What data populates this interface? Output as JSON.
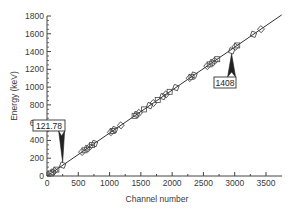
{
  "chart_data": {
    "type": "scatter",
    "title": "",
    "xlabel": "Channel number",
    "ylabel": "Energy (keV)",
    "xlim": [
      0,
      3750
    ],
    "ylim": [
      0,
      1800
    ],
    "xticks": [
      0,
      500,
      1000,
      1500,
      2000,
      2500,
      3000,
      3500
    ],
    "yticks": [
      0,
      200,
      400,
      600,
      800,
      1000,
      1200,
      1400,
      1600,
      1800
    ],
    "grid": false,
    "legend": null,
    "series": [
      {
        "name": "Calibration peaks",
        "marker": "open-square",
        "x": [
          60,
          90,
          120,
          150,
          250,
          560,
          600,
          640,
          680,
          720,
          760,
          1020,
          1050,
          1080,
          1180,
          1400,
          1430,
          1470,
          1550,
          1640,
          1700,
          1770,
          1850,
          1900,
          1960,
          2060,
          2280,
          2310,
          2350,
          2560,
          2600,
          2640,
          2680,
          2720,
          2950,
          3010,
          3040,
          3300,
          3420
        ],
        "y": [
          29,
          43,
          58,
          72,
          121.78,
          270,
          289,
          309,
          328,
          347,
          366,
          493,
          507,
          522,
          570,
          677,
          691,
          710,
          749,
          792,
          821,
          855,
          894,
          918,
          947,
          995,
          1102,
          1116,
          1135,
          1237,
          1256,
          1275,
          1295,
          1314,
          1408,
          1454,
          1469,
          1594,
          1652
        ]
      },
      {
        "name": "Linear fit",
        "type": "line",
        "x": [
          0,
          3750
        ],
        "y": [
          0,
          1812
        ]
      }
    ],
    "annotations": [
      {
        "text": "121.78",
        "x": 250,
        "y": 121.78,
        "box_position": "above-left"
      },
      {
        "text": "1408",
        "x": 2950,
        "y": 1408,
        "box_position": "below"
      }
    ]
  }
}
